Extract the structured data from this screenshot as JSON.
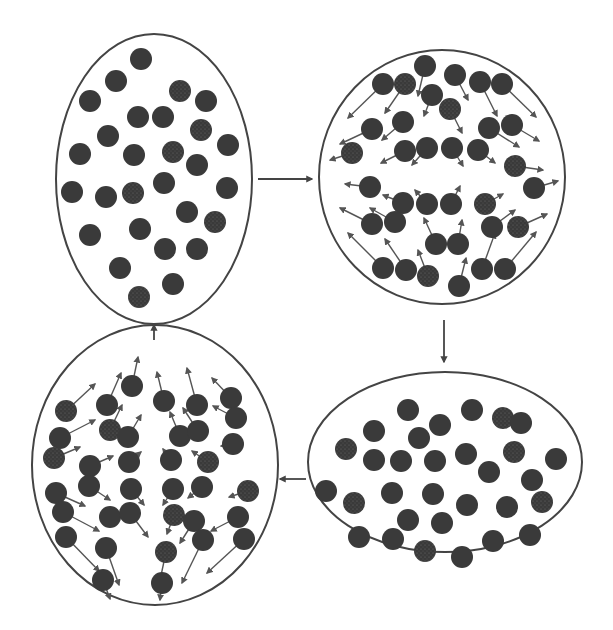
{
  "diagram": {
    "width": 613,
    "height": 630,
    "colors": {
      "outline": "#444444",
      "particle": "#3a3a3a",
      "particle_light": "#5a5a5a",
      "arrow": "#555555",
      "background": "#ffffff"
    },
    "particle_radius": 11,
    "stages": [
      {
        "id": "top-left",
        "ellipse": {
          "cx": 154,
          "cy": 179,
          "rx": 98,
          "ry": 145
        },
        "particles": [
          [
            141,
            59
          ],
          [
            116,
            81
          ],
          [
            180,
            91
          ],
          [
            206,
            101
          ],
          [
            90,
            101
          ],
          [
            138,
            117
          ],
          [
            163,
            117
          ],
          [
            201,
            130
          ],
          [
            108,
            136
          ],
          [
            228,
            145
          ],
          [
            80,
            154
          ],
          [
            134,
            155
          ],
          [
            173,
            152
          ],
          [
            197,
            165
          ],
          [
            164,
            183
          ],
          [
            72,
            192
          ],
          [
            106,
            197
          ],
          [
            133,
            193
          ],
          [
            227,
            188
          ],
          [
            187,
            212
          ],
          [
            90,
            235
          ],
          [
            140,
            229
          ],
          [
            215,
            222
          ],
          [
            165,
            249
          ],
          [
            197,
            249
          ],
          [
            120,
            268
          ],
          [
            173,
            284
          ],
          [
            139,
            297
          ]
        ],
        "vectors": []
      },
      {
        "id": "top-right",
        "ellipse": {
          "cx": 442,
          "cy": 177,
          "rx": 123,
          "ry": 127
        },
        "particles": [
          [
            425,
            66
          ],
          [
            383,
            84
          ],
          [
            405,
            84
          ],
          [
            455,
            75
          ],
          [
            480,
            82
          ],
          [
            502,
            84
          ],
          [
            432,
            95
          ],
          [
            450,
            109
          ],
          [
            372,
            129
          ],
          [
            403,
            122
          ],
          [
            489,
            128
          ],
          [
            512,
            125
          ],
          [
            352,
            153
          ],
          [
            405,
            151
          ],
          [
            427,
            148
          ],
          [
            452,
            148
          ],
          [
            478,
            150
          ],
          [
            515,
            166
          ],
          [
            370,
            187
          ],
          [
            403,
            203
          ],
          [
            427,
            204
          ],
          [
            451,
            204
          ],
          [
            485,
            204
          ],
          [
            534,
            188
          ],
          [
            372,
            224
          ],
          [
            395,
            222
          ],
          [
            492,
            227
          ],
          [
            518,
            227
          ],
          [
            436,
            244
          ],
          [
            458,
            244
          ],
          [
            383,
            268
          ],
          [
            406,
            270
          ],
          [
            428,
            276
          ],
          [
            459,
            286
          ],
          [
            482,
            269
          ],
          [
            505,
            269
          ]
        ],
        "vectors": [
          [
            383,
            84,
            348,
            118
          ],
          [
            405,
            84,
            385,
            113
          ],
          [
            425,
            66,
            418,
            96
          ],
          [
            432,
            95,
            424,
            116
          ],
          [
            455,
            75,
            468,
            100
          ],
          [
            480,
            82,
            497,
            116
          ],
          [
            502,
            84,
            536,
            117
          ],
          [
            450,
            109,
            462,
            133
          ],
          [
            372,
            129,
            340,
            144
          ],
          [
            403,
            122,
            382,
            140
          ],
          [
            489,
            128,
            519,
            147
          ],
          [
            512,
            125,
            539,
            141
          ],
          [
            352,
            153,
            330,
            160
          ],
          [
            405,
            151,
            381,
            163
          ],
          [
            427,
            148,
            412,
            165
          ],
          [
            452,
            148,
            463,
            166
          ],
          [
            478,
            150,
            495,
            163
          ],
          [
            515,
            166,
            543,
            170
          ],
          [
            370,
            187,
            345,
            184
          ],
          [
            403,
            203,
            383,
            195
          ],
          [
            427,
            204,
            415,
            190
          ],
          [
            451,
            204,
            460,
            186
          ],
          [
            485,
            204,
            503,
            194
          ],
          [
            534,
            188,
            558,
            181
          ],
          [
            372,
            224,
            340,
            208
          ],
          [
            395,
            222,
            370,
            208
          ],
          [
            492,
            227,
            515,
            210
          ],
          [
            518,
            227,
            547,
            214
          ],
          [
            436,
            244,
            424,
            218
          ],
          [
            458,
            244,
            462,
            220
          ],
          [
            383,
            268,
            348,
            233
          ],
          [
            406,
            270,
            385,
            239
          ],
          [
            428,
            276,
            418,
            250
          ],
          [
            459,
            286,
            466,
            258
          ],
          [
            482,
            269,
            495,
            233
          ],
          [
            505,
            269,
            536,
            232
          ]
        ]
      },
      {
        "id": "bottom-right",
        "ellipse": {
          "cx": 445,
          "cy": 462,
          "rx": 137,
          "ry": 90
        },
        "particles": [
          [
            408,
            410
          ],
          [
            472,
            410
          ],
          [
            503,
            418
          ],
          [
            521,
            423
          ],
          [
            374,
            431
          ],
          [
            419,
            438
          ],
          [
            440,
            425
          ],
          [
            346,
            449
          ],
          [
            374,
            460
          ],
          [
            401,
            461
          ],
          [
            435,
            461
          ],
          [
            466,
            454
          ],
          [
            514,
            452
          ],
          [
            556,
            459
          ],
          [
            489,
            472
          ],
          [
            532,
            480
          ],
          [
            326,
            491
          ],
          [
            354,
            503
          ],
          [
            392,
            493
          ],
          [
            433,
            494
          ],
          [
            467,
            505
          ],
          [
            507,
            507
          ],
          [
            542,
            502
          ],
          [
            408,
            520
          ],
          [
            442,
            523
          ],
          [
            359,
            537
          ],
          [
            393,
            539
          ],
          [
            425,
            551
          ],
          [
            462,
            557
          ],
          [
            493,
            541
          ],
          [
            530,
            535
          ]
        ],
        "vectors": []
      },
      {
        "id": "bottom-left",
        "ellipse": {
          "cx": 155,
          "cy": 465,
          "rx": 123,
          "ry": 140
        },
        "particles": [
          [
            132,
            386
          ],
          [
            107,
            405
          ],
          [
            66,
            411
          ],
          [
            231,
            398
          ],
          [
            164,
            401
          ],
          [
            197,
            405
          ],
          [
            60,
            438
          ],
          [
            110,
            430
          ],
          [
            128,
            437
          ],
          [
            236,
            418
          ],
          [
            180,
            436
          ],
          [
            198,
            431
          ],
          [
            54,
            458
          ],
          [
            233,
            444
          ],
          [
            90,
            466
          ],
          [
            129,
            462
          ],
          [
            171,
            460
          ],
          [
            208,
            462
          ],
          [
            89,
            486
          ],
          [
            131,
            489
          ],
          [
            173,
            489
          ],
          [
            202,
            487
          ],
          [
            248,
            491
          ],
          [
            56,
            493
          ],
          [
            63,
            512
          ],
          [
            110,
            517
          ],
          [
            130,
            513
          ],
          [
            174,
            515
          ],
          [
            194,
            521
          ],
          [
            238,
            517
          ],
          [
            66,
            537
          ],
          [
            106,
            548
          ],
          [
            166,
            552
          ],
          [
            203,
            540
          ],
          [
            244,
            539
          ],
          [
            103,
            580
          ],
          [
            162,
            583
          ]
        ],
        "vectors": [
          [
            132,
            386,
            138,
            357
          ],
          [
            107,
            405,
            121,
            373
          ],
          [
            66,
            411,
            95,
            384
          ],
          [
            164,
            401,
            157,
            372
          ],
          [
            197,
            405,
            187,
            368
          ],
          [
            231,
            398,
            212,
            378
          ],
          [
            60,
            438,
            95,
            420
          ],
          [
            110,
            430,
            122,
            405
          ],
          [
            128,
            437,
            141,
            415
          ],
          [
            180,
            436,
            170,
            412
          ],
          [
            198,
            431,
            183,
            408
          ],
          [
            236,
            418,
            213,
            406
          ],
          [
            54,
            458,
            80,
            447
          ],
          [
            90,
            466,
            113,
            456
          ],
          [
            129,
            462,
            141,
            452
          ],
          [
            171,
            460,
            163,
            449
          ],
          [
            208,
            462,
            192,
            451
          ],
          [
            233,
            444,
            221,
            446
          ],
          [
            89,
            486,
            110,
            500
          ],
          [
            131,
            489,
            144,
            505
          ],
          [
            173,
            489,
            163,
            505
          ],
          [
            202,
            487,
            188,
            498
          ],
          [
            248,
            491,
            229,
            497
          ],
          [
            56,
            493,
            85,
            506
          ],
          [
            63,
            512,
            99,
            531
          ],
          [
            130,
            513,
            148,
            537
          ],
          [
            174,
            515,
            167,
            534
          ],
          [
            194,
            521,
            180,
            543
          ],
          [
            238,
            517,
            211,
            531
          ],
          [
            66,
            537,
            99,
            571
          ],
          [
            106,
            548,
            119,
            585
          ],
          [
            166,
            552,
            159,
            585
          ],
          [
            203,
            540,
            182,
            583
          ],
          [
            244,
            539,
            207,
            573
          ],
          [
            103,
            580,
            110,
            599
          ],
          [
            162,
            583,
            160,
            600
          ]
        ]
      }
    ],
    "transitions": [
      {
        "id": "arrow-top-left-to-top-right",
        "x1": 258,
        "y1": 179,
        "x2": 312,
        "y2": 179
      },
      {
        "id": "arrow-top-right-to-bottom-right",
        "x1": 444,
        "y1": 320,
        "x2": 444,
        "y2": 362
      },
      {
        "id": "arrow-bottom-right-to-bottom-left",
        "x1": 306,
        "y1": 479,
        "x2": 280,
        "y2": 479
      },
      {
        "id": "arrow-bottom-left-to-top-left",
        "x1": 154,
        "y1": 340,
        "x2": 154,
        "y2": 325
      }
    ]
  }
}
